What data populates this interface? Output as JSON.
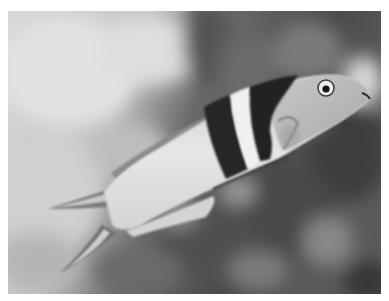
{
  "image": {
    "type": "photograph",
    "colorspace": "grayscale",
    "subject": "fish",
    "description": "Black-and-white photograph of a wrasse-like fish swimming diagonally upward to the right, with two dark vertical bands behind the head separated by a white band, against a blurred reef background",
    "colors": {
      "border": "#ffffff",
      "background_light": "#d6d6d6",
      "background_dark": "#3a3a3a",
      "fish_body": "#dcdcdc",
      "fish_band": "#2a2a2a"
    }
  }
}
